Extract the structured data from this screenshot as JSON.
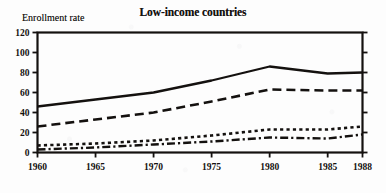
{
  "chart_data": {
    "type": "line",
    "title": "Low-income countries",
    "ylabel": "Enrollment rate",
    "xlabel": "",
    "xlim": [
      1960,
      1988
    ],
    "ylim": [
      0,
      120
    ],
    "grid": false,
    "legend": "none",
    "y_ticks": [
      0,
      20,
      40,
      60,
      80,
      100,
      120
    ],
    "x_ticks": [
      1960,
      1965,
      1970,
      1975,
      1980,
      1985,
      1988
    ],
    "x": [
      1960,
      1965,
      1970,
      1975,
      1980,
      1985,
      1988
    ],
    "series": [
      {
        "name": "Primary",
        "style": "solid",
        "values": [
          46,
          53,
          60,
          72,
          86,
          79,
          80
        ]
      },
      {
        "name": "Primary, female",
        "style": "dashed",
        "values": [
          26,
          33,
          40,
          51,
          63,
          62,
          62
        ]
      },
      {
        "name": "Secondary",
        "style": "dotted",
        "values": [
          7,
          9,
          12,
          17,
          23,
          23,
          26
        ]
      },
      {
        "name": "Secondary, female",
        "style": "dash-dot",
        "values": [
          3,
          5,
          8,
          11,
          15,
          14,
          18
        ]
      }
    ]
  },
  "axis": {
    "y_tick_labels": [
      "0",
      "20",
      "40",
      "60",
      "80",
      "100",
      "120"
    ],
    "x_tick_labels": [
      "1960",
      "1965",
      "1970",
      "1975",
      "1980",
      "1985",
      "1988"
    ]
  },
  "colors": {
    "ink": "#14110f",
    "paper": "#fdfdfd"
  }
}
